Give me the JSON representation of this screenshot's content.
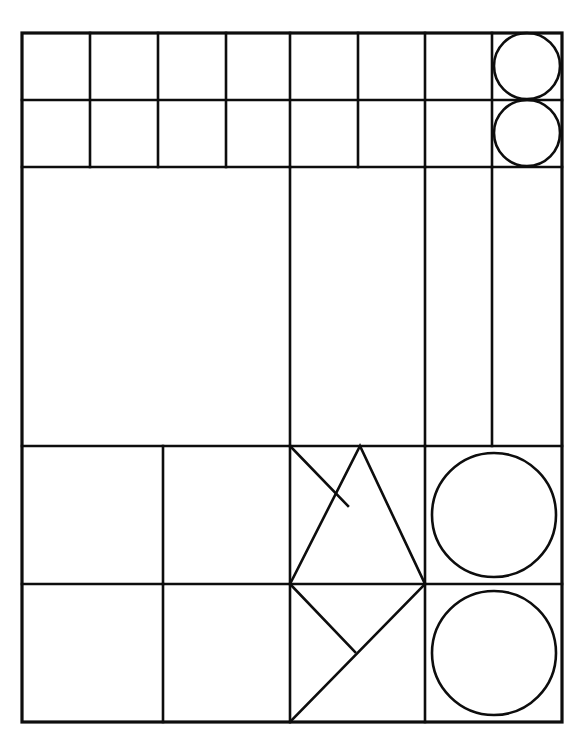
{
  "figure": {
    "canvas": {
      "width": 588,
      "height": 744
    },
    "background_color": "#ffffff",
    "stroke_color": "#0d0d0d"
  },
  "frame": {
    "label": "outer-rectangle",
    "x0": 22,
    "y0": 33,
    "x1": 562,
    "y1": 722
  },
  "bands": [
    {
      "name": "band-1-top-squares",
      "y0": 33,
      "y1": 100
    },
    {
      "name": "band-2-second-squares",
      "y0": 100,
      "y1": 167
    },
    {
      "name": "band-3-tall-columns",
      "y0": 167,
      "y1": 446
    },
    {
      "name": "band-4-triangle-row",
      "y0": 446,
      "y1": 584
    },
    {
      "name": "band-5-bottom-row",
      "y0": 584,
      "y1": 722
    }
  ],
  "horizontal_lines": [
    33,
    100,
    167,
    446,
    584,
    722
  ],
  "vertical_dividers": {
    "band_1": [
      90,
      158,
      226,
      290,
      358,
      425,
      492
    ],
    "band_2": [
      90,
      158,
      226,
      290,
      358,
      425,
      492
    ],
    "band_3": [
      290,
      425,
      492
    ],
    "band_4": [
      163,
      290,
      425
    ],
    "band_5": [
      163,
      290,
      425
    ]
  },
  "circles": [
    {
      "name": "circle-top-row-right",
      "cx": 527,
      "cy": 66,
      "r": 33,
      "band": "band-1-top-squares"
    },
    {
      "name": "circle-second-row-right",
      "cx": 527,
      "cy": 133,
      "r": 33,
      "band": "band-2-second-squares"
    },
    {
      "name": "circle-fourth-row-right",
      "cx": 494,
      "cy": 515,
      "r": 62,
      "band": "band-4-triangle-row"
    },
    {
      "name": "circle-fifth-row-right",
      "cx": 494,
      "cy": 653,
      "r": 62,
      "band": "band-5-bottom-row"
    }
  ],
  "polylines": [
    {
      "name": "triangle-upright-band4",
      "points": "290,584 360,446 425,584"
    },
    {
      "name": "chevron-upper-left-band4",
      "points": "290,446 348,506"
    },
    {
      "name": "diagonal-main-band5",
      "points": "290,722 425,584"
    },
    {
      "name": "chevron-upper-left-band5",
      "points": "290,584 355,652"
    }
  ],
  "cells": {
    "band_1": [
      "cell-r1-c1",
      "cell-r1-c2",
      "cell-r1-c3",
      "cell-r1-c4",
      "cell-r1-c5",
      "cell-r1-c6",
      "cell-r1-c7",
      "cell-r1-c8-circle"
    ],
    "band_2": [
      "cell-r2-c1",
      "cell-r2-c2",
      "cell-r2-c3",
      "cell-r2-c4",
      "cell-r2-c5",
      "cell-r2-c6",
      "cell-r2-c7",
      "cell-r2-c8-circle"
    ],
    "band_3": [
      "cell-r3-c1-large",
      "cell-r3-c2-large",
      "cell-r3-c3-narrow",
      "cell-r3-c4-narrow"
    ],
    "band_4": [
      "cell-r4-c1",
      "cell-r4-c2",
      "cell-r4-c3-triangle",
      "cell-r4-c4-circle"
    ],
    "band_5": [
      "cell-r5-c1",
      "cell-r5-c2",
      "cell-r5-c3-diagonals",
      "cell-r5-c4-circle"
    ]
  }
}
